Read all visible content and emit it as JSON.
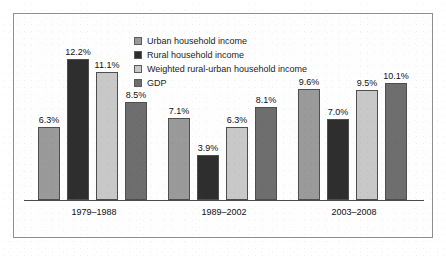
{
  "chart_data": {
    "type": "bar",
    "title": "",
    "xlabel": "",
    "ylabel": "",
    "ylim": [
      0,
      13
    ],
    "grid": false,
    "legend_position": "top-center",
    "categories": [
      "1979–1988",
      "1989–2002",
      "2003–2008"
    ],
    "series": [
      {
        "name": "Urban household income",
        "color": "#9a9a9a",
        "values": [
          6.3,
          7.1,
          9.6
        ],
        "labels": [
          "6.3%",
          "7.1%",
          "9.6%"
        ]
      },
      {
        "name": "Rural household income",
        "color": "#2e2e2e",
        "values": [
          12.2,
          3.9,
          7.0
        ],
        "labels": [
          "12.2%",
          "3.9%",
          "7.0%"
        ]
      },
      {
        "name": "Weighted rural-urban household income",
        "color": "#c8c8c8",
        "values": [
          11.1,
          6.3,
          9.5
        ],
        "labels": [
          "11.1%",
          "6.3%",
          "9.5%"
        ]
      },
      {
        "name": "GDP",
        "color": "#6e6e6e",
        "values": [
          8.5,
          8.1,
          10.1
        ],
        "labels": [
          "8.5%",
          "8.1%",
          "10.1%"
        ]
      }
    ]
  },
  "legend": {
    "items": [
      {
        "label": "Urban household income",
        "color": "#9a9a9a"
      },
      {
        "label": "Rural household income",
        "color": "#2e2e2e"
      },
      {
        "label": "Weighted rural-urban household income",
        "color": "#c8c8c8"
      },
      {
        "label": "GDP",
        "color": "#6e6e6e"
      }
    ]
  },
  "axis": {
    "tick_labels": [
      "1979–1988",
      "1989–2002",
      "2003–2008"
    ]
  },
  "style": {
    "frame_color": "#8e8e8e",
    "baseline_color": "#4a4a4a",
    "text_color": "#111111",
    "background": "#ffffff"
  }
}
